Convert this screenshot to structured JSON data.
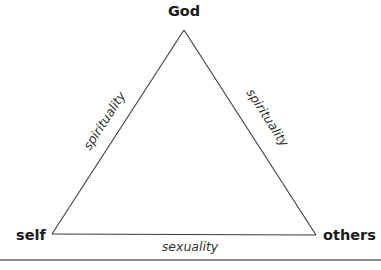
{
  "diagram": {
    "vertices": {
      "top": {
        "label": "God",
        "x": 184,
        "y": 30
      },
      "bottom_left": {
        "label": "self",
        "x": 52,
        "y": 234
      },
      "bottom_right": {
        "label": "others",
        "x": 316,
        "y": 235
      }
    },
    "edges": {
      "left": {
        "label": "spirituality",
        "from": "self",
        "to": "God"
      },
      "right": {
        "label": "spirituality",
        "from": "God",
        "to": "others"
      },
      "bottom": {
        "label": "sexuality",
        "from": "self",
        "to": "others"
      }
    },
    "colors": {
      "line": "#3a3a3a",
      "text": "#1a1a1a",
      "edge_text": "#333333",
      "rule": "#8a8a8a"
    }
  },
  "caption": {
    "text": ""
  }
}
